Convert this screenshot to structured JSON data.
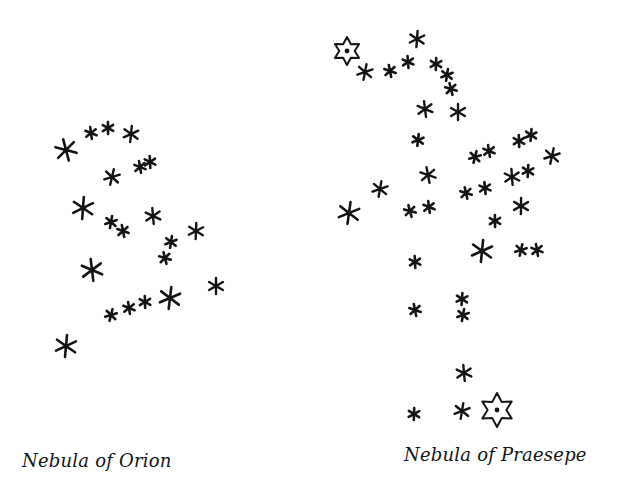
{
  "figure": {
    "ink_color": "#141414",
    "background": "#ffffff",
    "panels": [
      {
        "id": "orion",
        "caption": "Nebula of Orion",
        "stars": [
          {
            "x": 66,
            "y": 150,
            "size": "large"
          },
          {
            "x": 91,
            "y": 133,
            "size": "small"
          },
          {
            "x": 108,
            "y": 128,
            "size": "small"
          },
          {
            "x": 131,
            "y": 134,
            "size": "medium"
          },
          {
            "x": 112,
            "y": 177,
            "size": "medium"
          },
          {
            "x": 140,
            "y": 167,
            "size": "small"
          },
          {
            "x": 150,
            "y": 162,
            "size": "small"
          },
          {
            "x": 83,
            "y": 208,
            "size": "large"
          },
          {
            "x": 111,
            "y": 222,
            "size": "small"
          },
          {
            "x": 123,
            "y": 231,
            "size": "small"
          },
          {
            "x": 153,
            "y": 216,
            "size": "medium"
          },
          {
            "x": 196,
            "y": 231,
            "size": "medium"
          },
          {
            "x": 171,
            "y": 242,
            "size": "small"
          },
          {
            "x": 165,
            "y": 258,
            "size": "small"
          },
          {
            "x": 92,
            "y": 270,
            "size": "large"
          },
          {
            "x": 216,
            "y": 286,
            "size": "medium"
          },
          {
            "x": 170,
            "y": 298,
            "size": "large"
          },
          {
            "x": 111,
            "y": 315,
            "size": "small"
          },
          {
            "x": 129,
            "y": 308,
            "size": "small"
          },
          {
            "x": 145,
            "y": 302,
            "size": "small"
          },
          {
            "x": 66,
            "y": 346,
            "size": "large"
          }
        ],
        "outlined_stars": []
      },
      {
        "id": "praesepe",
        "caption": "Nebula of Praesepe",
        "stars": [
          {
            "x": 417,
            "y": 39,
            "size": "medium"
          },
          {
            "x": 365,
            "y": 72,
            "size": "medium"
          },
          {
            "x": 390,
            "y": 71,
            "size": "small"
          },
          {
            "x": 408,
            "y": 62,
            "size": "small"
          },
          {
            "x": 436,
            "y": 64,
            "size": "small"
          },
          {
            "x": 447,
            "y": 75,
            "size": "small"
          },
          {
            "x": 451,
            "y": 89,
            "size": "small"
          },
          {
            "x": 425,
            "y": 109,
            "size": "medium"
          },
          {
            "x": 458,
            "y": 112,
            "size": "medium"
          },
          {
            "x": 418,
            "y": 140,
            "size": "small"
          },
          {
            "x": 475,
            "y": 157,
            "size": "small"
          },
          {
            "x": 489,
            "y": 151,
            "size": "small"
          },
          {
            "x": 519,
            "y": 141,
            "size": "small"
          },
          {
            "x": 531,
            "y": 135,
            "size": "small"
          },
          {
            "x": 552,
            "y": 156,
            "size": "medium"
          },
          {
            "x": 428,
            "y": 175,
            "size": "medium"
          },
          {
            "x": 512,
            "y": 177,
            "size": "medium"
          },
          {
            "x": 528,
            "y": 171,
            "size": "small"
          },
          {
            "x": 380,
            "y": 189,
            "size": "medium"
          },
          {
            "x": 466,
            "y": 193,
            "size": "small"
          },
          {
            "x": 485,
            "y": 188,
            "size": "small"
          },
          {
            "x": 521,
            "y": 206,
            "size": "medium"
          },
          {
            "x": 349,
            "y": 213,
            "size": "large"
          },
          {
            "x": 410,
            "y": 211,
            "size": "small"
          },
          {
            "x": 429,
            "y": 207,
            "size": "small"
          },
          {
            "x": 495,
            "y": 221,
            "size": "small"
          },
          {
            "x": 482,
            "y": 251,
            "size": "large"
          },
          {
            "x": 521,
            "y": 250,
            "size": "small"
          },
          {
            "x": 537,
            "y": 250,
            "size": "small"
          },
          {
            "x": 415,
            "y": 262,
            "size": "small"
          },
          {
            "x": 462,
            "y": 299,
            "size": "small"
          },
          {
            "x": 463,
            "y": 315,
            "size": "small"
          },
          {
            "x": 415,
            "y": 310,
            "size": "small"
          },
          {
            "x": 464,
            "y": 373,
            "size": "medium"
          },
          {
            "x": 414,
            "y": 414,
            "size": "small"
          },
          {
            "x": 462,
            "y": 411,
            "size": "medium"
          }
        ],
        "outlined_stars": [
          {
            "x": 347,
            "y": 51,
            "r": 14
          },
          {
            "x": 497,
            "y": 410,
            "r": 17
          }
        ]
      }
    ]
  }
}
